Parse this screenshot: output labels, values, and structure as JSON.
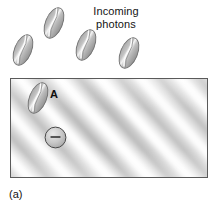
{
  "figure": {
    "panel_label": "(a)",
    "caption_title": "Incoming photons",
    "caption_line_1": "Incoming",
    "caption_line_2": "photons",
    "photon_a_label": "A",
    "electron_sign": "−",
    "background_color": "#ffffff",
    "text_color": "#141414"
  },
  "slab": {
    "name": "metal surface",
    "border_color": "#5a5a5a",
    "fill_color": "#d8d8d8",
    "highlight_color": "#ffffff",
    "shadow_color": "#b0b0b0",
    "left": 10,
    "top": 78,
    "width": 198,
    "height": 100,
    "texture": "diagonal brushed stripes"
  },
  "photons": [
    {
      "id": "photon-1",
      "label": "",
      "left": 13,
      "top": 33,
      "rotation": 22,
      "location": "above-surface"
    },
    {
      "id": "photon-2",
      "label": "",
      "left": 44,
      "top": 6,
      "rotation": 22,
      "location": "above-surface"
    },
    {
      "id": "photon-3",
      "label": "",
      "left": 76,
      "top": 28,
      "rotation": 22,
      "location": "above-surface"
    },
    {
      "id": "photon-4",
      "label": "",
      "left": 119,
      "top": 36,
      "rotation": 22,
      "location": "above-surface"
    },
    {
      "id": "photon-a",
      "label": "A",
      "left": 28,
      "top": 81,
      "rotation": 22,
      "location": "on-surface"
    }
  ],
  "electron": {
    "id": "electron-1",
    "sign": "−",
    "left": 44,
    "top": 126,
    "diameter": 23,
    "fill_color": "#c9c9c9",
    "border_color": "#4a4a4a"
  },
  "photon_style": {
    "fill_color": "#b4b4b4",
    "highlight_color": "#f2f2f2",
    "outline_color": "#6e6e6e",
    "width": 20,
    "height": 34
  }
}
